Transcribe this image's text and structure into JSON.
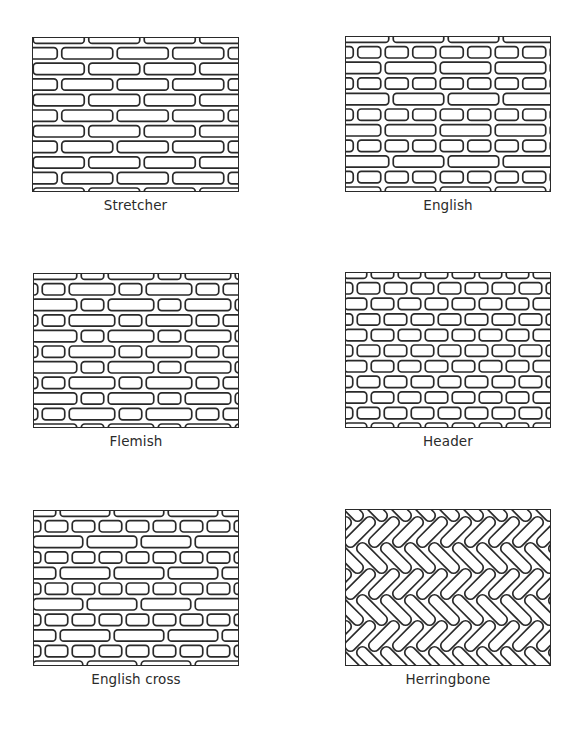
{
  "figure": {
    "stroke_color": "#2a2a2a",
    "background": "#ffffff",
    "panels": [
      {
        "id": "stretcher",
        "label": "Stretcher",
        "pattern": "stretcher",
        "frame": {
          "x": 32,
          "y": 37,
          "w": 207,
          "h": 155
        }
      },
      {
        "id": "english",
        "label": "English",
        "pattern": "english",
        "frame": {
          "x": 345,
          "y": 36,
          "w": 206,
          "h": 156
        }
      },
      {
        "id": "flemish",
        "label": "Flemish",
        "pattern": "flemish",
        "frame": {
          "x": 33,
          "y": 273,
          "w": 206,
          "h": 155
        }
      },
      {
        "id": "header",
        "label": "Header",
        "pattern": "header",
        "frame": {
          "x": 345,
          "y": 272,
          "w": 206,
          "h": 156
        }
      },
      {
        "id": "english-cross",
        "label": "English cross",
        "pattern": "english-cross",
        "frame": {
          "x": 33,
          "y": 510,
          "w": 206,
          "h": 156
        }
      },
      {
        "id": "herringbone",
        "label": "Herringbone",
        "pattern": "herringbone",
        "frame": {
          "x": 345,
          "y": 509,
          "w": 206,
          "h": 157
        }
      }
    ]
  }
}
